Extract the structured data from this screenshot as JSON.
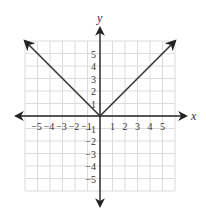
{
  "chart_data": {
    "type": "line",
    "title": "",
    "xlabel": "x",
    "ylabel": "y",
    "xlim": [
      -6,
      6
    ],
    "ylim": [
      -6,
      6
    ],
    "grid": true,
    "x_ticks": [
      -5,
      -4,
      -3,
      -2,
      -1,
      1,
      2,
      3,
      4,
      5
    ],
    "y_ticks": [
      5,
      4,
      3,
      2,
      1,
      -1,
      -2,
      -3,
      -4,
      -5
    ],
    "x_tick_labels": [
      "−5",
      "−4",
      "−3",
      "−2",
      "−1",
      "1",
      "2",
      "3",
      "4",
      "5"
    ],
    "y_tick_labels": [
      "5",
      "4",
      "3",
      "2",
      "1",
      "−1",
      "−2",
      "−3",
      "−4",
      "−5"
    ],
    "series": [
      {
        "name": "y = |x|",
        "x": [
          -6,
          0,
          6
        ],
        "y": [
          6,
          0,
          6
        ],
        "arrows_at_ends": true
      }
    ],
    "legend": null
  },
  "colors": {
    "grid": "#dcdcdc",
    "axis": "#222222",
    "curve": "#333333",
    "text": "#333333"
  }
}
